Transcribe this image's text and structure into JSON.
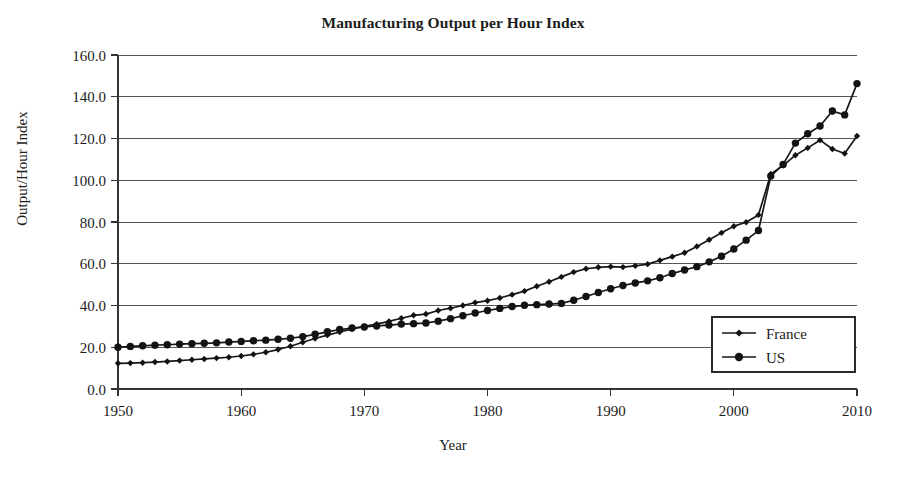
{
  "chart_data": {
    "type": "line",
    "title": "Manufacturing Output per Hour Index",
    "xlabel": "Year",
    "ylabel": "Output/Hour Index",
    "xlim": [
      1950,
      2010
    ],
    "ylim": [
      0.0,
      160.0
    ],
    "ytick_labels": [
      "160.0",
      "140.0",
      "120.0",
      "100.0",
      "80.0",
      "60.0",
      "40.0",
      "20.0",
      "0.0"
    ],
    "ytick_values": [
      160,
      140,
      120,
      100,
      80,
      60,
      40,
      20,
      0
    ],
    "xtick_labels": [
      "1950",
      "1960",
      "1970",
      "1980",
      "1990",
      "2000",
      "2010"
    ],
    "xtick_values": [
      1950,
      1960,
      1970,
      1980,
      1990,
      2000,
      2010
    ],
    "grid": "horizontal",
    "legend_position": "lower-right",
    "x": [
      1950,
      1951,
      1952,
      1953,
      1954,
      1955,
      1956,
      1957,
      1958,
      1959,
      1960,
      1961,
      1962,
      1963,
      1964,
      1965,
      1966,
      1967,
      1968,
      1969,
      1970,
      1971,
      1972,
      1973,
      1974,
      1975,
      1976,
      1977,
      1978,
      1979,
      1980,
      1981,
      1982,
      1983,
      1984,
      1985,
      1986,
      1987,
      1988,
      1989,
      1990,
      1991,
      1992,
      1993,
      1994,
      1995,
      1996,
      1997,
      1998,
      1999,
      2000,
      2001,
      2002,
      2003,
      2004,
      2005,
      2006,
      2007,
      2008,
      2009,
      2010
    ],
    "series": [
      {
        "name": "France",
        "marker": "diamond",
        "values": [
          12.3,
          12.4,
          12.6,
          12.9,
          13.2,
          13.6,
          14.0,
          14.4,
          14.8,
          15.2,
          15.8,
          16.6,
          17.6,
          18.9,
          20.5,
          22.4,
          24.2,
          25.8,
          27.3,
          28.8,
          30.0,
          31.1,
          32.4,
          33.9,
          35.3,
          35.9,
          37.6,
          38.7,
          40.0,
          41.4,
          42.3,
          43.6,
          45.2,
          46.9,
          49.2,
          51.4,
          53.7,
          56.0,
          57.6,
          58.3,
          58.6,
          58.4,
          59.0,
          59.8,
          61.6,
          63.4,
          65.3,
          68.3,
          71.5,
          74.8,
          78.0,
          79.9,
          83.4,
          88.0,
          94.6,
          99.5,
          104.0,
          107.5,
          110.6,
          113.2,
          117.8
        ]
      },
      {
        "name": "US",
        "marker": "circle",
        "values": [
          20.0,
          20.4,
          20.7,
          21.0,
          21.2,
          21.5,
          21.7,
          21.9,
          22.1,
          22.5,
          22.8,
          23.1,
          23.4,
          23.8,
          24.3,
          25.1,
          26.2,
          27.4,
          28.5,
          29.2,
          29.7,
          30.2,
          30.6,
          31.1,
          31.3,
          31.6,
          32.5,
          33.7,
          35.1,
          36.4,
          37.6,
          38.6,
          39.5,
          40.1,
          40.4,
          40.7,
          41.0,
          42.5,
          44.3,
          46.2,
          48.0,
          49.6,
          50.8,
          51.8,
          53.3,
          55.3,
          57.0,
          58.6,
          60.9,
          63.6,
          67.1,
          71.3,
          75.9,
          79.2,
          85.6,
          90.0,
          95.0,
          101.0,
          107.0,
          113.0,
          117.2
        ]
      }
    ],
    "series_overrides_us_tail": [
      {
        "year": 2003,
        "value": 102.0
      },
      {
        "year": 2004,
        "value": 107.6
      },
      {
        "year": 2005,
        "value": 117.8
      },
      {
        "year": 2006,
        "value": 122.3
      },
      {
        "year": 2007,
        "value": 126.0
      },
      {
        "year": 2008,
        "value": 133.2
      },
      {
        "year": 2009,
        "value": 131.3
      },
      {
        "year": 2010,
        "value": 138.0
      }
    ],
    "series_overrides_france_tail": [
      {
        "year": 2003,
        "value": 103.0
      },
      {
        "year": 2004,
        "value": 107.0
      },
      {
        "year": 2005,
        "value": 112.0
      },
      {
        "year": 2006,
        "value": 115.5
      },
      {
        "year": 2007,
        "value": 119.2
      },
      {
        "year": 2008,
        "value": 115.0
      },
      {
        "year": 2009,
        "value": 112.8
      },
      {
        "year": 2010,
        "value": 121.2
      }
    ],
    "endpoint_us_2010": 146.3,
    "endpoint_france_2010": 121.2
  },
  "legend": {
    "entries": [
      {
        "label": "France",
        "marker": "diamond"
      },
      {
        "label": "US",
        "marker": "circle"
      }
    ]
  }
}
